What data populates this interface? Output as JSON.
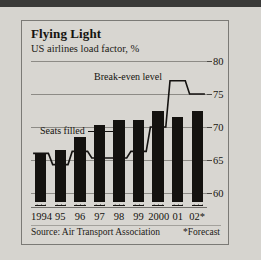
{
  "figure": {
    "title": "Flying Light",
    "subtitle": "US airlines load factor, %",
    "source": "Source: Air Transport Association",
    "forecast_note": "*Forecast"
  },
  "annotations": {
    "breakeven_label": "Break-even level",
    "seats_label": "Seats filled"
  },
  "chart_data": {
    "type": "bar",
    "title": "Flying Light",
    "subtitle": "US airlines load factor, %",
    "xlabel": "",
    "ylabel": "US airlines load factor, %",
    "ylim": [
      58,
      80
    ],
    "yticks": [
      60,
      65,
      70,
      75,
      80
    ],
    "ytick_labels": [
      "60",
      "65",
      "70",
      "75",
      "80"
    ],
    "grid": true,
    "legend": "none",
    "categories": [
      "1994",
      "95",
      "96",
      "97",
      "98",
      "99",
      "2000",
      "01",
      "02*"
    ],
    "series": [
      {
        "name": "Seats filled",
        "type": "bar",
        "color": "#14120f",
        "values": [
          66.0,
          66.5,
          68.5,
          70.3,
          71.0,
          71.0,
          72.5,
          71.5,
          72.5
        ]
      },
      {
        "name": "Break-even level",
        "type": "step",
        "color": "#141210",
        "values": [
          66.0,
          64.3,
          66.3,
          65.3,
          65.3,
          66.3,
          70.0,
          77.0,
          75.0
        ]
      }
    ],
    "notes": [
      "*Forecast"
    ],
    "source": "Source: Air Transport Association"
  }
}
